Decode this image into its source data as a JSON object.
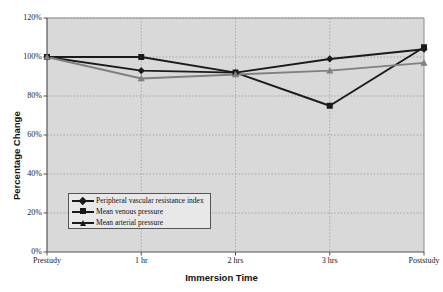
{
  "chart_data": {
    "type": "line",
    "title": "",
    "xlabel": "Immersion Time",
    "ylabel": "Percentage Change",
    "categories": [
      "Prestudy",
      "1 hr",
      "2 hrs",
      "3 hrs",
      "Poststudy"
    ],
    "ylim": [
      0,
      120
    ],
    "yticks": [
      "0%",
      "20%",
      "40%",
      "60%",
      "80%",
      "100%",
      "120%"
    ],
    "ytick_values": [
      0,
      20,
      40,
      60,
      80,
      100,
      120
    ],
    "grid": true,
    "grid_style": "dashed",
    "legend_position": "inside-lower-left",
    "plot_background": "#d9d9d9",
    "series": [
      {
        "name": "Peripheral vascular resistance index",
        "marker": "diamond",
        "color": "#1a1a1a",
        "values": [
          100,
          93,
          92,
          99,
          104
        ]
      },
      {
        "name": "Mean venous pressure",
        "marker": "square",
        "color": "#1a1a1a",
        "values": [
          100,
          100,
          92,
          75,
          105
        ]
      },
      {
        "name": "Mean arterial pressure",
        "marker": "triangle",
        "color": "#808080",
        "values": [
          100,
          89,
          91,
          93,
          97
        ]
      }
    ]
  },
  "colors": {
    "plot_bg": "#d9d9d9",
    "axis": "#555555",
    "grid": "#9a9a9a",
    "series_black": "#1a1a1a",
    "series_gray": "#808080",
    "legend_bg": "#e8e8e8"
  }
}
